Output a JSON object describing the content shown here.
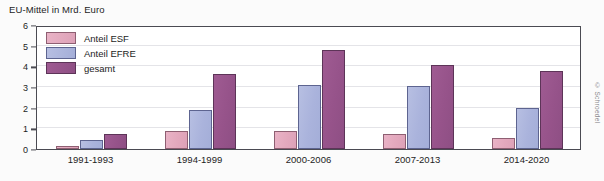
{
  "chart_data": {
    "type": "bar",
    "title": "EU-Mittel in Mrd. Euro",
    "xlabel": "",
    "ylabel": "",
    "ylim": [
      0,
      6
    ],
    "yticks": [
      0,
      1,
      2,
      3,
      4,
      5,
      6
    ],
    "grid": true,
    "legend_position": "upper-left-inside",
    "categories": [
      "1991-1993",
      "1994-1999",
      "2000-2006",
      "2007-2013",
      "2014-2020"
    ],
    "series": [
      {
        "name": "Anteil ESF",
        "color": "#e3a8bd",
        "values": [
          0.17,
          0.87,
          0.87,
          0.75,
          0.55
        ]
      },
      {
        "name": "Anteil EFRE",
        "color": "#aab3dc",
        "values": [
          0.45,
          1.9,
          3.1,
          3.05,
          1.97
        ]
      },
      {
        "name": "gesamt",
        "color": "#96538a",
        "values": [
          0.73,
          3.65,
          4.8,
          4.08,
          3.78
        ]
      }
    ],
    "credit": "© Schroedel"
  },
  "legend": {
    "items": [
      {
        "label": "Anteil ESF"
      },
      {
        "label": "Anteil EFRE"
      },
      {
        "label": "gesamt"
      }
    ]
  },
  "colors": {
    "esf": "#e3a8bd",
    "efre": "#aab3dc",
    "gesamt": "#96538a",
    "frame": "#4a4a52",
    "grid": "#e4e4e8"
  }
}
